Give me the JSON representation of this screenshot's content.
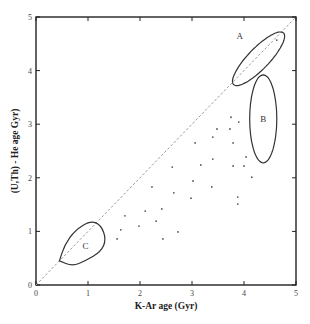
{
  "chart_data": {
    "type": "scatter",
    "title": "",
    "xlabel": "K-Ar  age (Gyr)",
    "ylabel": "(U,Th) - He  age Gyr)",
    "xlim": [
      0,
      5
    ],
    "ylim": [
      0,
      5
    ],
    "xticks": [
      "0",
      "1",
      "2",
      "3",
      "4",
      "5"
    ],
    "yticks": [
      "0",
      "1",
      "2",
      "3",
      "4",
      "5"
    ],
    "grid": false,
    "reference_line": {
      "type": "1:1",
      "from": [
        0,
        0
      ],
      "to": [
        5,
        5
      ],
      "style": "dashed"
    },
    "series": [
      {
        "name": "samples",
        "points": [
          [
            2.62,
            2.2
          ],
          [
            2.23,
            1.83
          ],
          [
            2.65,
            1.72
          ],
          [
            2.1,
            1.38
          ],
          [
            2.42,
            1.42
          ],
          [
            1.71,
            1.29
          ],
          [
            2.31,
            1.19
          ],
          [
            1.98,
            1.1
          ],
          [
            1.63,
            1.03
          ],
          [
            2.73,
            0.99
          ],
          [
            1.56,
            0.86
          ],
          [
            2.44,
            0.86
          ],
          [
            3.75,
            3.13
          ],
          [
            3.9,
            3.04
          ],
          [
            3.48,
            2.91
          ],
          [
            3.73,
            2.91
          ],
          [
            3.4,
            2.76
          ],
          [
            3.06,
            2.65
          ],
          [
            3.79,
            2.65
          ],
          [
            3.4,
            2.35
          ],
          [
            4.04,
            2.39
          ],
          [
            3.17,
            2.24
          ],
          [
            3.79,
            2.22
          ],
          [
            4.0,
            2.22
          ],
          [
            3.02,
            1.94
          ],
          [
            3.38,
            1.83
          ],
          [
            2.98,
            1.62
          ],
          [
            3.88,
            1.64
          ],
          [
            3.88,
            1.51
          ],
          [
            4.15,
            2.01
          ],
          [
            4.63,
            4.57
          ]
        ]
      }
    ],
    "regions": [
      {
        "label": "A",
        "shape": "ellipse",
        "center": [
          4.28,
          4.22
        ],
        "semi_major": 0.68,
        "semi_minor": 0.2,
        "angle_deg": 45
      },
      {
        "label": "B",
        "shape": "ellipse",
        "center": [
          4.37,
          3.1
        ],
        "semi_major": 0.82,
        "semi_minor": 0.26,
        "angle_deg": 90
      },
      {
        "label": "C",
        "shape": "loop",
        "center": [
          0.95,
          0.75
        ],
        "outline": [
          [
            0.45,
            0.45
          ],
          [
            0.55,
            0.75
          ],
          [
            0.75,
            1.02
          ],
          [
            1.05,
            1.2
          ],
          [
            1.25,
            1.12
          ],
          [
            1.35,
            0.85
          ],
          [
            1.25,
            0.62
          ],
          [
            0.95,
            0.45
          ],
          [
            0.7,
            0.35
          ],
          [
            0.45,
            0.45
          ]
        ]
      }
    ]
  }
}
